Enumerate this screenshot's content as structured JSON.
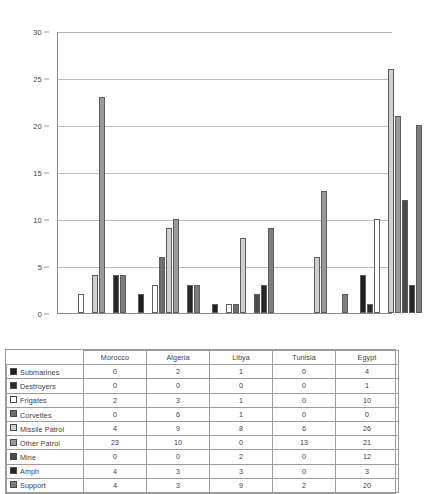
{
  "chart_data": {
    "type": "bar",
    "title": "",
    "xlabel": "",
    "ylabel": "",
    "ylim": [
      0,
      30
    ],
    "yticks": [
      0,
      5,
      10,
      15,
      20,
      25,
      30
    ],
    "grid": true,
    "legend_position": "table-row-headers",
    "categories": [
      "Morocco",
      "Algeria",
      "Libya",
      "Tunisia",
      "Egypt"
    ],
    "series": [
      {
        "name": "Submarines",
        "values": [
          0,
          2,
          1,
          0,
          4
        ],
        "color": "#1f1f1f"
      },
      {
        "name": "Destroyers",
        "values": [
          0,
          0,
          0,
          0,
          1
        ],
        "color": "#2b2b2b"
      },
      {
        "name": "Frigates",
        "values": [
          2,
          3,
          1,
          0,
          10
        ],
        "color": "#ffffff"
      },
      {
        "name": "Corvettes",
        "values": [
          0,
          6,
          1,
          0,
          0
        ],
        "color": "#6e6e6e"
      },
      {
        "name": "Missile Patrol",
        "values": [
          4,
          9,
          8,
          6,
          26
        ],
        "color": "#cfcfcf"
      },
      {
        "name": "Other Patrol",
        "values": [
          23,
          10,
          0,
          13,
          21
        ],
        "color": "#9a9a9a"
      },
      {
        "name": "Mine",
        "values": [
          0,
          0,
          2,
          0,
          12
        ],
        "color": "#4a4a4a"
      },
      {
        "name": "Amph",
        "values": [
          4,
          3,
          3,
          0,
          3
        ],
        "color": "#262626"
      },
      {
        "name": "Support",
        "values": [
          4,
          3,
          9,
          2,
          20
        ],
        "color": "#7d7d7d"
      }
    ]
  },
  "table": {
    "corner_label": "",
    "column_headers": [
      "Morocco",
      "Algeria",
      "Libya",
      "Tunisia",
      "Egypt"
    ],
    "rows": [
      {
        "label": "Submarines",
        "values": [
          "0",
          "2",
          "1",
          "0",
          "4"
        ]
      },
      {
        "label": "Destroyers",
        "values": [
          "0",
          "0",
          "0",
          "0",
          "1"
        ]
      },
      {
        "label": "Frigates",
        "values": [
          "2",
          "3",
          "1",
          "0",
          "10"
        ]
      },
      {
        "label": "Corvettes",
        "values": [
          "0",
          "6",
          "1",
          "0",
          "0"
        ]
      },
      {
        "label": "Missile Patrol",
        "values": [
          "4",
          "9",
          "8",
          "6",
          "26"
        ]
      },
      {
        "label": "Other Patrol",
        "values": [
          "23",
          "10",
          "0",
          "13",
          "21"
        ]
      },
      {
        "label": "Mine",
        "values": [
          "0",
          "0",
          "2",
          "0",
          "12"
        ]
      },
      {
        "label": "Amph",
        "values": [
          "4",
          "3",
          "3",
          "0",
          "3"
        ]
      },
      {
        "label": "Support",
        "values": [
          "4",
          "3",
          "9",
          "2",
          "20"
        ]
      }
    ]
  }
}
